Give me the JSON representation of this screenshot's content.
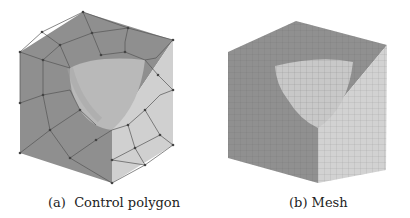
{
  "figure": {
    "subfigures": [
      {
        "label": "(a)",
        "caption": "Control polygon"
      },
      {
        "label": "(b)",
        "caption": "Mesh"
      }
    ]
  },
  "colors": {
    "face_left": "#8f8f8f",
    "face_top": "#8a8a8a",
    "face_right": "#cfcfcf",
    "cavity": "#b7b7b7",
    "mesh_line": "#555555",
    "vertex": "#444444"
  }
}
